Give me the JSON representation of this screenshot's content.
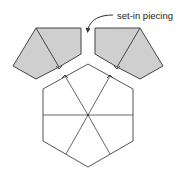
{
  "diagram": {
    "annotation": {
      "label": "set-in piecing",
      "arrow_icon": "curved-arrow-down-left"
    },
    "colors": {
      "shaded_fill": "#cfcfcf",
      "outline": "#444444",
      "background": "#ffffff"
    },
    "pieces": [
      {
        "name": "left-shaded-unit",
        "shaded": true,
        "segments": 2
      },
      {
        "name": "right-shaded-unit",
        "shaded": true,
        "segments": 2
      },
      {
        "name": "hexagon-block",
        "shaded": false,
        "segments": 6
      }
    ]
  }
}
